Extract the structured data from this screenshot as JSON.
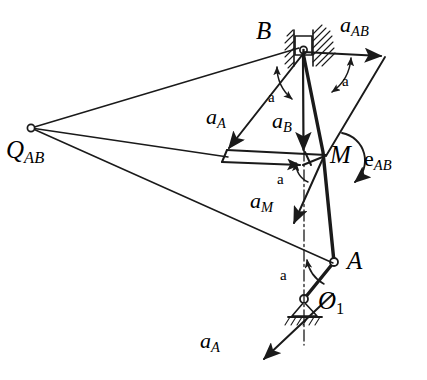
{
  "figure": {
    "kind": "kinematics-acceleration-diagram",
    "stroke_color": "#1a1a1a",
    "background_color": "#ffffff"
  },
  "points": [
    {
      "id": "B",
      "label": "B",
      "sub": "",
      "x": 303,
      "y": 52,
      "label_x": 256,
      "label_y": 18,
      "style": "slider-pivot"
    },
    {
      "id": "M",
      "label": "M",
      "sub": "",
      "x": 325,
      "y": 155,
      "label_x": 330,
      "label_y": 142,
      "style": "plain"
    },
    {
      "id": "A",
      "label": "A",
      "sub": "",
      "x": 334,
      "y": 262,
      "label_x": 347,
      "label_y": 248,
      "style": "pin"
    },
    {
      "id": "O1",
      "label": "O",
      "sub": "1",
      "x": 304,
      "y": 299,
      "label_x": 318,
      "label_y": 288,
      "style": "ground-pivot"
    },
    {
      "id": "QAB",
      "label": "Q",
      "sub": "AB",
      "x": 31,
      "y": 128,
      "label_x": 6,
      "label_y": 137,
      "style": "pole"
    }
  ],
  "vectors": [
    {
      "id": "a_AB_top",
      "label": "a",
      "sub": "AB",
      "label_x": 340,
      "label_y": 14,
      "from_x": 303,
      "from_y": 52,
      "to_x": 383,
      "to_y": 56
    },
    {
      "id": "a_A_mid",
      "label": "a",
      "sub": "A",
      "label_x": 206,
      "label_y": 106,
      "from_x": 303,
      "from_y": 52,
      "to_x": 227,
      "to_y": 150
    },
    {
      "id": "a_B_mid",
      "label": "a",
      "sub": "B",
      "label_x": 272,
      "label_y": 110,
      "from_x": 303,
      "from_y": 57,
      "to_x": 304,
      "to_y": 152
    },
    {
      "id": "a_M",
      "label": "a",
      "sub": "M",
      "label_x": 250,
      "label_y": 190,
      "from_x": 325,
      "from_y": 155,
      "to_x": 292,
      "to_y": 226
    },
    {
      "id": "a_A_bottom",
      "label": "a",
      "sub": "A",
      "label_x": 200,
      "label_y": 330,
      "from_x": 332,
      "from_y": 296,
      "to_x": 262,
      "to_y": 361
    }
  ],
  "angular": {
    "id": "e_AB",
    "label": "e",
    "sub": "AB",
    "label_x": 364,
    "label_y": 148,
    "arc_start_x": 343,
    "arc_start_y": 133,
    "arc_end_x": 357,
    "arc_end_y": 186
  },
  "angle_marks": [
    {
      "id": "alpha-B-left",
      "label": "a",
      "label_x": 268,
      "label_y": 90
    },
    {
      "id": "alpha-B-right",
      "label": "a",
      "label_x": 342,
      "label_y": 74
    },
    {
      "id": "alpha-M",
      "label": "a",
      "label_x": 277,
      "label_y": 172
    },
    {
      "id": "alpha-O1",
      "label": "a",
      "label_x": 280,
      "label_y": 268
    }
  ],
  "guides": {
    "centerline_label": "vertical dash-dot centerline through O1",
    "ground_label": "fixed ground hatching at O1",
    "slider_label": "prismatic guide hatching at B"
  }
}
